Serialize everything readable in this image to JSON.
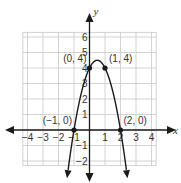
{
  "chart_data": {
    "type": "line",
    "title": "",
    "xlabel": "x",
    "ylabel": "y",
    "xlim": [
      -4.3,
      4.3
    ],
    "ylim": [
      -2.3,
      6.3
    ],
    "grid": true,
    "x_ticks": [
      -4,
      -3,
      -2,
      -1,
      1,
      2,
      3,
      4
    ],
    "y_ticks": [
      -2,
      -1,
      1,
      2,
      3,
      4,
      5,
      6
    ],
    "x_tick_labels": [
      "−4",
      "−3",
      "−2",
      "−1",
      "1",
      "2",
      "3",
      "4"
    ],
    "y_tick_labels": [
      "−2",
      "−1",
      "1",
      "2",
      "3",
      "4",
      "5",
      "6"
    ],
    "series": [
      {
        "name": "parabola",
        "equation": "y = -2x^2 + 2x + 4",
        "x": [
          -1.4,
          -1,
          -0.5,
          0,
          0.5,
          1,
          1.5,
          2,
          2.4
        ],
        "values": [
          -2.72,
          0,
          2.5,
          4,
          4.5,
          4,
          2.5,
          0,
          -2.72
        ],
        "arrows": "both ends"
      }
    ],
    "points": [
      {
        "x": -1,
        "y": 0,
        "label": "(−1, 0)"
      },
      {
        "x": 0,
        "y": 4,
        "label": "(0, 4)"
      },
      {
        "x": 1,
        "y": 4,
        "label": "(1, 4)"
      },
      {
        "x": 2,
        "y": 0,
        "label": "(2, 0)"
      }
    ],
    "legend": null
  },
  "colors": {
    "curve": "#1a1a1a",
    "grid": "#c8c8c8",
    "axes": "#1a1a1a",
    "text": "#333333"
  }
}
